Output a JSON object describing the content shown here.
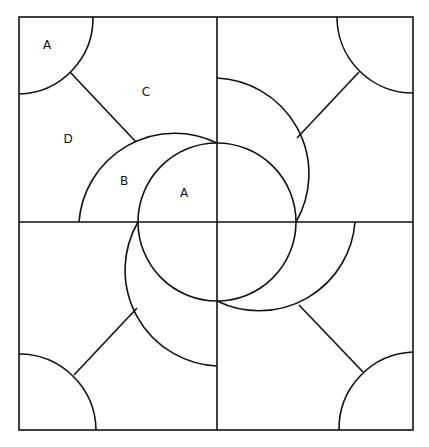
{
  "diagram": {
    "labels": [
      {
        "id": "corner-a",
        "text": "A",
        "x": 47,
        "y": 45
      },
      {
        "id": "region-c",
        "text": "C",
        "x": 146,
        "y": 92
      },
      {
        "id": "region-d",
        "text": "D",
        "x": 68,
        "y": 139
      },
      {
        "id": "crescent-b",
        "text": "B",
        "x": 124,
        "y": 181
      },
      {
        "id": "center-a",
        "text": "A",
        "x": 184,
        "y": 193
      }
    ],
    "colors": {
      "stroke": "#111111",
      "background": "#ffffff"
    }
  }
}
